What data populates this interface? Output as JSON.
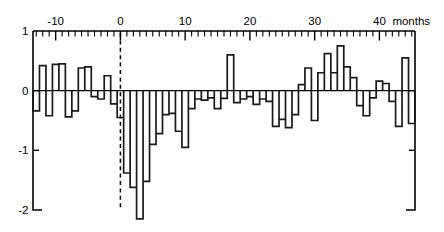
{
  "chart_data": {
    "type": "bar",
    "title": "",
    "subtitle": "",
    "xlabel": "months",
    "ylabel": "",
    "xlim": [
      -13.5,
      45.5
    ],
    "ylim": [
      -2.0,
      1.0
    ],
    "grid": false,
    "legend": false,
    "x_ticks_major": [
      -10,
      0,
      10,
      20,
      30,
      40
    ],
    "x_tick_labels": [
      "-10",
      "0",
      "10",
      "20",
      "30",
      "40"
    ],
    "x_tick_minor_step": 1,
    "y_ticks": [
      1,
      0,
      -1,
      -2
    ],
    "y_tick_labels": [
      "1",
      "0",
      "-1",
      "-2"
    ],
    "units_text": "months",
    "event_marker_x": 0,
    "annotations": [
      {
        "label": "event-month-dashed-line",
        "x": 0
      }
    ],
    "x": [
      -13,
      -12,
      -11,
      -10,
      -9,
      -8,
      -7,
      -6,
      -5,
      -4,
      -3,
      -2,
      -1,
      0,
      1,
      2,
      3,
      4,
      5,
      6,
      7,
      8,
      9,
      10,
      11,
      12,
      13,
      14,
      15,
      16,
      17,
      18,
      19,
      20,
      21,
      22,
      23,
      24,
      25,
      26,
      27,
      28,
      29,
      30,
      31,
      32,
      33,
      34,
      35,
      36,
      37,
      38,
      39,
      40,
      41,
      42,
      43,
      44,
      45
    ],
    "values": [
      -0.34,
      0.42,
      -0.42,
      0.44,
      0.45,
      -0.44,
      -0.34,
      0.38,
      0.4,
      -0.1,
      -0.14,
      0.25,
      -0.22,
      -0.45,
      -1.38,
      -1.62,
      -2.15,
      -1.52,
      -0.9,
      -0.72,
      -0.4,
      -0.38,
      -0.68,
      -0.95,
      -0.3,
      -0.14,
      -0.16,
      -0.12,
      -0.3,
      -0.13,
      0.6,
      -0.2,
      -0.14,
      -0.1,
      -0.23,
      -0.14,
      -0.18,
      -0.6,
      -0.48,
      -0.62,
      -0.4,
      0.1,
      0.38,
      -0.5,
      0.3,
      0.62,
      0.3,
      0.75,
      0.4,
      0.22,
      -0.25,
      -0.42,
      -0.12,
      0.16,
      0.12,
      -0.18,
      -0.6,
      0.55,
      -0.55
    ]
  },
  "figure": {
    "bar_color": "#1a1a1a",
    "background": "#ffffff",
    "axis_color": "#000000"
  }
}
